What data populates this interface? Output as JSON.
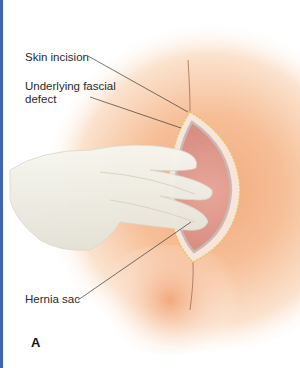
{
  "figure": {
    "panel_letter": "A",
    "labels": {
      "skin_incision": "Skin incision",
      "fascial_defect": "Underlying fascial defect",
      "hernia_sac": "Hernia sac"
    },
    "colors": {
      "skin": "#f4b48a",
      "sac": "#e8a898",
      "glove": "#f2f1ea",
      "border": "#3f63b5",
      "suture": "#e0c860"
    }
  }
}
